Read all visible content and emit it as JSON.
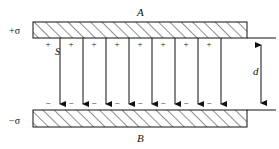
{
  "figure": {
    "title_top_plate": "A",
    "title_bottom_plate": "B",
    "charge_density_top": "+σ",
    "charge_density_bottom": "−σ",
    "area_label": "S",
    "separation_label": "d",
    "plus_sign": "+",
    "minus_sign": "−",
    "plus_count": 8,
    "minus_count": 8,
    "field_line_count": 8,
    "colors": {
      "ink": "#111111",
      "hatch": "#222222",
      "background": "#ffffff"
    }
  },
  "geometry": {
    "top_plate": {
      "x": 33,
      "y": 22,
      "width": 214,
      "height": 16
    },
    "bottom_plate": {
      "x": 33,
      "y": 110,
      "width": 214,
      "height": 17
    },
    "field_line_x": [
      60,
      83,
      106,
      129,
      152,
      175,
      198,
      221
    ],
    "field_line_top_y": 38,
    "field_line_bottom_y": 110,
    "plus_sign_x": [
      48,
      71,
      94,
      117,
      140,
      163,
      186,
      209
    ],
    "plus_sign_y": 40,
    "minus_sign_x": [
      48,
      71,
      94,
      117,
      140,
      163,
      186,
      209
    ],
    "minus_sign_y": 101,
    "dimension_x": 261,
    "dimension_top_y": 38,
    "dimension_bottom_y": 110,
    "extension_right_x": 276
  }
}
